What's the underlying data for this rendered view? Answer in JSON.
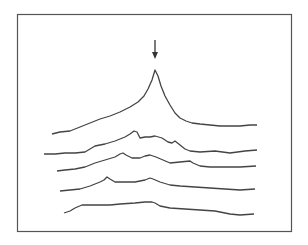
{
  "chart_data": {
    "type": "line",
    "title": "",
    "xlabel": "",
    "ylabel": "",
    "grid": false,
    "legend": null,
    "annotations": [
      {
        "type": "arrow",
        "label": "",
        "points_to": "peak of top trace",
        "x_px": 155
      }
    ],
    "frame": {
      "x": 17,
      "y": 14,
      "width": 274,
      "height": 217,
      "stroke": "#555555"
    },
    "line_color": "#444444",
    "series": [
      {
        "name": "trace-1",
        "points": [
          [
            52,
            134
          ],
          [
            60,
            132
          ],
          [
            70,
            131
          ],
          [
            80,
            127
          ],
          [
            90,
            123
          ],
          [
            100,
            119
          ],
          [
            110,
            116
          ],
          [
            120,
            112
          ],
          [
            130,
            107
          ],
          [
            138,
            102
          ],
          [
            144,
            96
          ],
          [
            148,
            89
          ],
          [
            152,
            80
          ],
          [
            155,
            70
          ],
          [
            158,
            76
          ],
          [
            161,
            86
          ],
          [
            165,
            96
          ],
          [
            170,
            105
          ],
          [
            175,
            113
          ],
          [
            180,
            118
          ],
          [
            186,
            121
          ],
          [
            192,
            123
          ],
          [
            200,
            124
          ],
          [
            210,
            125
          ],
          [
            220,
            126
          ],
          [
            230,
            126
          ],
          [
            240,
            126
          ],
          [
            250,
            125
          ],
          [
            257,
            125
          ]
        ]
      },
      {
        "name": "trace-2",
        "points": [
          [
            44,
            154
          ],
          [
            55,
            154
          ],
          [
            65,
            153
          ],
          [
            75,
            153
          ],
          [
            85,
            152
          ],
          [
            90,
            149
          ],
          [
            95,
            146
          ],
          [
            105,
            144
          ],
          [
            115,
            141
          ],
          [
            125,
            137
          ],
          [
            130,
            134
          ],
          [
            134,
            131
          ],
          [
            137,
            132
          ],
          [
            140,
            138
          ],
          [
            145,
            137
          ],
          [
            150,
            137
          ],
          [
            155,
            136
          ],
          [
            162,
            138
          ],
          [
            168,
            142
          ],
          [
            172,
            143
          ],
          [
            175,
            141
          ],
          [
            180,
            145
          ],
          [
            185,
            149
          ],
          [
            190,
            151
          ],
          [
            200,
            152
          ],
          [
            215,
            151
          ],
          [
            230,
            153
          ],
          [
            245,
            151
          ],
          [
            257,
            150
          ]
        ]
      },
      {
        "name": "trace-3",
        "points": [
          [
            57,
            171
          ],
          [
            65,
            170
          ],
          [
            75,
            169
          ],
          [
            85,
            167
          ],
          [
            95,
            163
          ],
          [
            105,
            160
          ],
          [
            115,
            157
          ],
          [
            120,
            154
          ],
          [
            123,
            153
          ],
          [
            126,
            155
          ],
          [
            132,
            158
          ],
          [
            140,
            158
          ],
          [
            145,
            156
          ],
          [
            150,
            155
          ],
          [
            156,
            157
          ],
          [
            163,
            160
          ],
          [
            170,
            163
          ],
          [
            180,
            162
          ],
          [
            190,
            161
          ],
          [
            193,
            163
          ],
          [
            200,
            166
          ],
          [
            210,
            167
          ],
          [
            225,
            167
          ],
          [
            240,
            167
          ],
          [
            256,
            166
          ]
        ]
      },
      {
        "name": "trace-4",
        "points": [
          [
            60,
            191
          ],
          [
            70,
            190
          ],
          [
            80,
            189
          ],
          [
            90,
            186
          ],
          [
            100,
            182
          ],
          [
            104,
            180
          ],
          [
            107,
            177
          ],
          [
            110,
            179
          ],
          [
            115,
            182
          ],
          [
            125,
            182
          ],
          [
            135,
            182
          ],
          [
            145,
            180
          ],
          [
            150,
            178
          ],
          [
            153,
            179
          ],
          [
            160,
            182
          ],
          [
            170,
            185
          ],
          [
            180,
            186
          ],
          [
            195,
            187
          ],
          [
            210,
            188
          ],
          [
            225,
            189
          ],
          [
            240,
            190
          ],
          [
            255,
            189
          ]
        ]
      },
      {
        "name": "trace-5",
        "points": [
          [
            64,
            213
          ],
          [
            70,
            211
          ],
          [
            75,
            208
          ],
          [
            82,
            205
          ],
          [
            95,
            205
          ],
          [
            110,
            205
          ],
          [
            120,
            204
          ],
          [
            135,
            203
          ],
          [
            145,
            202
          ],
          [
            152,
            202
          ],
          [
            155,
            203
          ],
          [
            160,
            206
          ],
          [
            170,
            208
          ],
          [
            185,
            209
          ],
          [
            200,
            210
          ],
          [
            215,
            211
          ],
          [
            230,
            214
          ],
          [
            240,
            215
          ],
          [
            254,
            214
          ]
        ]
      }
    ]
  }
}
